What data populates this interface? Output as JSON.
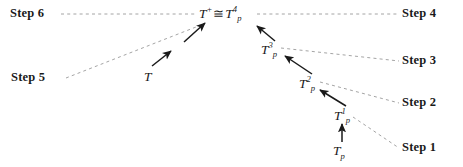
{
  "figure": {
    "background_color": "#ffffff",
    "line_color": "#9a9a9a",
    "arrow_color": "#1a1a1a",
    "text_color": "#1a1a1a",
    "width": 463,
    "height": 167
  },
  "step_labels": [
    {
      "id": "step6",
      "text": "Step 6",
      "x": 10,
      "y": 7
    },
    {
      "id": "step5",
      "text": "Step 5",
      "x": 11,
      "y": 71
    },
    {
      "id": "step4",
      "text": "Step 4",
      "x": 402,
      "y": 7
    },
    {
      "id": "step3",
      "text": "Step 3",
      "x": 402,
      "y": 54
    },
    {
      "id": "step2",
      "text": "Step 2",
      "x": 402,
      "y": 96
    },
    {
      "id": "step1",
      "text": "Step 1",
      "x": 402,
      "y": 141
    }
  ],
  "math_nodes": [
    {
      "id": "t-plus-iso-tp4",
      "base": "T",
      "sup": "+",
      "iso": "≅",
      "base2": "T",
      "sub2": "p",
      "sup2": "4",
      "x": 199,
      "y": 5
    },
    {
      "id": "tp3",
      "base": "T",
      "sub": "p",
      "sup": "3",
      "x": 261,
      "y": 41
    },
    {
      "id": "tp2",
      "base": "T",
      "sub": "p",
      "sup": "2",
      "x": 299,
      "y": 75
    },
    {
      "id": "tp1",
      "base": "T",
      "sub": "p",
      "sup": "1",
      "x": 334,
      "y": 107
    },
    {
      "id": "tp",
      "base": "T",
      "sub": "p",
      "sup": "",
      "x": 333,
      "y": 144
    },
    {
      "id": "t",
      "base": "T",
      "sub": "",
      "sup": "",
      "x": 144,
      "y": 70
    }
  ],
  "dashed_connectors": [
    {
      "id": "step6-to-center",
      "from_x": 61,
      "from_y": 14,
      "to_x": 196,
      "to_y": 14
    },
    {
      "id": "step4-to-center",
      "from_x": 257,
      "from_y": 14,
      "to_x": 398,
      "to_y": 14
    },
    {
      "id": "step3-to-tp3",
      "from_x": 281,
      "from_y": 48,
      "to_x": 399,
      "to_y": 61
    },
    {
      "id": "step2-to-tp2",
      "from_x": 320,
      "from_y": 82,
      "to_x": 399,
      "to_y": 103
    },
    {
      "id": "step1-to-tp1",
      "from_x": 353,
      "from_y": 117,
      "to_x": 399,
      "to_y": 148
    },
    {
      "id": "step5-to-t",
      "from_x": 66,
      "from_y": 78,
      "to_x": 196,
      "to_y": 27
    }
  ],
  "arrows": [
    {
      "id": "arrow-t-to-chain",
      "from_x": 152,
      "from_y": 66,
      "to_x": 171,
      "to_y": 51
    },
    {
      "id": "arrow-chain-upper",
      "from_x": 184,
      "from_y": 42,
      "to_x": 205,
      "to_y": 23
    },
    {
      "id": "arrow-tp3-to-tp4",
      "from_x": 275,
      "from_y": 41,
      "to_x": 257,
      "to_y": 26
    },
    {
      "id": "arrow-tp2-to-tp3",
      "from_x": 312,
      "from_y": 74,
      "to_x": 285,
      "to_y": 56
    },
    {
      "id": "arrow-tp1-to-tp2",
      "from_x": 346,
      "from_y": 106,
      "to_x": 320,
      "to_y": 90
    },
    {
      "id": "arrow-tp-to-tp1",
      "from_x": 342,
      "from_y": 142,
      "to_x": 342,
      "to_y": 124
    }
  ]
}
